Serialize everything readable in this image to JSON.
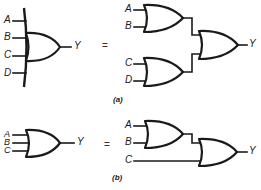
{
  "figure": {
    "part_a": {
      "caption": "(a)",
      "equals": "=",
      "left": {
        "inputs": [
          "A",
          "B",
          "C",
          "D"
        ],
        "output": "Y",
        "description": "4-input OR gate (extended-back symbol)"
      },
      "right": {
        "gate1_inputs": [
          "A",
          "B"
        ],
        "gate2_inputs": [
          "C",
          "D"
        ],
        "output": "Y",
        "description": "Two 2-input OR gates feeding a 2-input OR gate"
      }
    },
    "part_b": {
      "caption": "(b)",
      "equals": "=",
      "left": {
        "inputs": [
          "A",
          "B",
          "C"
        ],
        "output": "Y",
        "description": "3-input OR gate"
      },
      "right": {
        "gate1_inputs": [
          "A",
          "B"
        ],
        "gate2_extra_input": "C",
        "output": "Y",
        "description": "2-input OR gate cascaded with a second 2-input OR gate"
      }
    }
  }
}
